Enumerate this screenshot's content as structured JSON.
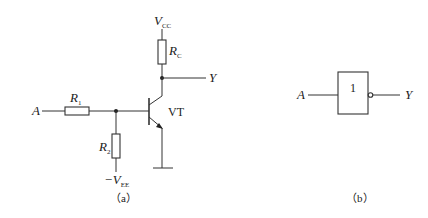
{
  "figure_a": {
    "caption": "（a）",
    "input_label": "A",
    "output_label": "Y",
    "supply_label": "V",
    "supply_sub": "CC",
    "neg_supply_prefix": "−V",
    "neg_supply_sub": "EE",
    "r1_label": "R",
    "r1_sub": "1",
    "r2_label": "R",
    "r2_sub": "2",
    "rc_label": "R",
    "rc_sub": "C",
    "transistor_label": "VT"
  },
  "figure_b": {
    "caption": "（b）",
    "input_label": "A",
    "output_label": "Y",
    "gate_symbol": "1"
  },
  "colors": {
    "stroke": "#333333",
    "text": "#222222",
    "background": "#ffffff"
  }
}
